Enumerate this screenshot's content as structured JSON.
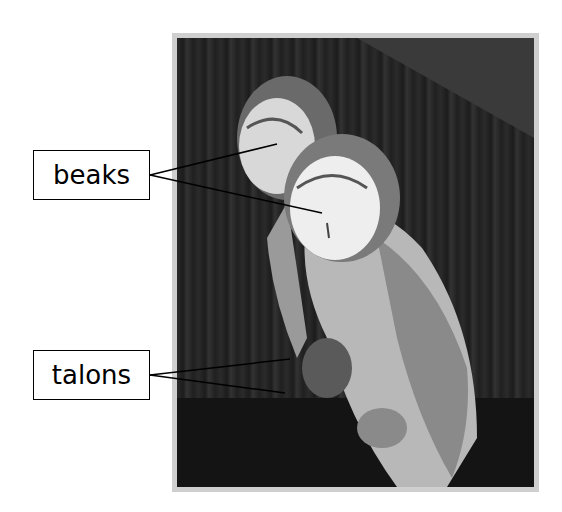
{
  "figure": {
    "labels": [
      {
        "id": "beaks",
        "text": "beaks"
      },
      {
        "id": "talons",
        "text": "talons"
      }
    ]
  },
  "colors": {
    "label_border": "#000000",
    "frame": "#cfcfcf",
    "background": "#ffffff"
  }
}
